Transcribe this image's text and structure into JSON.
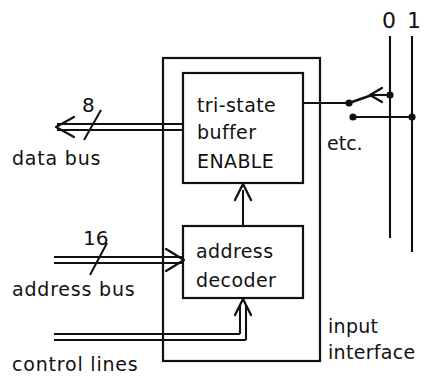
{
  "diagram": {
    "blocks": [
      {
        "id": "tristate",
        "line1": "tri-state",
        "line2": "buffer",
        "line3": "ENABLE"
      },
      {
        "id": "decoder",
        "line1": "address",
        "line2": "decoder"
      }
    ],
    "buses": [
      {
        "id": "data-bus",
        "width": "8",
        "label": "data bus",
        "direction": "out"
      },
      {
        "id": "address-bus",
        "width": "16",
        "label": "address bus",
        "direction": "in"
      },
      {
        "id": "control-lines",
        "width": "",
        "label": "control lines",
        "direction": "in"
      }
    ],
    "enclosure_label_line1": "input",
    "enclosure_label_line2": "interface",
    "etc_label": "etc.",
    "rails": [
      {
        "id": "rail-0",
        "label": "0"
      },
      {
        "id": "rail-1",
        "label": "1"
      }
    ],
    "colors": {
      "ink": "#111111",
      "paper": "#ffffff"
    }
  }
}
